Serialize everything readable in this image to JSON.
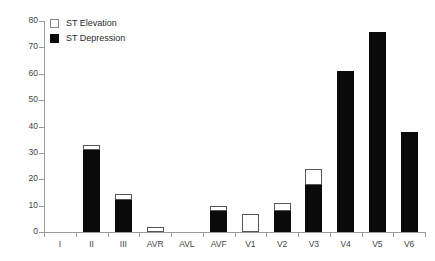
{
  "chart_data": {
    "type": "bar",
    "title": "",
    "subtitle": "",
    "xlabel": "",
    "ylabel": "",
    "stacked": true,
    "grid": false,
    "legend_position": "top-left",
    "ylim": [
      0,
      80
    ],
    "ytick_step": 10,
    "ytick_labels": [
      "0",
      "10",
      "20",
      "30",
      "40",
      "50",
      "60",
      "70",
      "80"
    ],
    "ytick_values": [
      0,
      10,
      20,
      30,
      40,
      50,
      60,
      70,
      80
    ],
    "categories": [
      "I",
      "II",
      "III",
      "AVR",
      "AVL",
      "AVF",
      "V1",
      "V2",
      "V3",
      "V4",
      "V5",
      "V6"
    ],
    "series": [
      {
        "name": "ST Depression",
        "color": "#0a0a0a",
        "values": [
          0,
          31,
          12,
          0,
          0,
          8,
          0,
          8,
          18,
          61,
          76,
          38
        ]
      },
      {
        "name": "ST Elevation",
        "color": "#ffffff",
        "values": [
          0,
          2,
          2.5,
          2,
          0,
          2,
          7,
          3,
          6,
          0,
          0,
          0
        ]
      }
    ],
    "totals": [
      0,
      33,
      14.5,
      2,
      0,
      10,
      7,
      11,
      24,
      61,
      76,
      38
    ]
  },
  "legend": {
    "entries": [
      {
        "label": "ST Elevation",
        "swatch": "open-square"
      },
      {
        "label": "ST Depression",
        "swatch": "filled-square"
      }
    ]
  },
  "colors": {
    "depression": "#0a0a0a",
    "elevation": "#ffffff",
    "axis": "#9a9a9a",
    "text": "#444444",
    "background": "#ffffff"
  }
}
